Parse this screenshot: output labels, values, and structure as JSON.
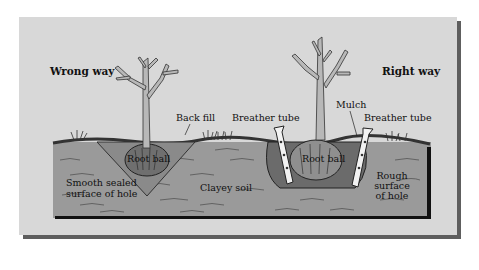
{
  "diagram": {
    "colors": {
      "background": "#ffffff",
      "panel": "#d8d8d8",
      "panel_shadow": "#5e5e5e",
      "soil": "#9a9a9a",
      "soil_edge": "#111111",
      "tree": "#b8b8b8",
      "tube": "#f2f2f2"
    },
    "sections": {
      "wrong": {
        "title": "Wrong way",
        "labels": {
          "back_fill": "Back fill",
          "root_ball": "Root ball",
          "hole_surface_line1": "Smooth sealed",
          "hole_surface_line2": "surface of hole"
        }
      },
      "center": {
        "soil_label": "Clayey soil",
        "breather_tube_left": "Breather tube"
      },
      "right": {
        "title": "Right way",
        "labels": {
          "mulch": "Mulch",
          "breather_tube": "Breather tube",
          "root_ball": "Root ball",
          "hole_surface_line1": "Rough",
          "hole_surface_line2": "surface",
          "hole_surface_line3": "of hole"
        }
      }
    }
  }
}
